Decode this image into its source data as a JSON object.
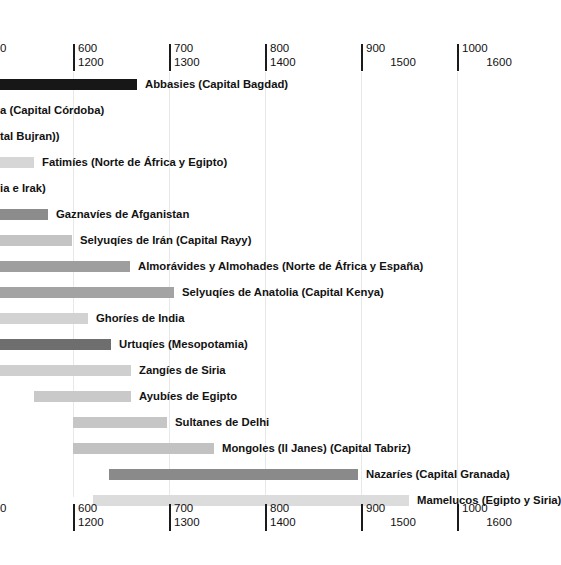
{
  "chart_data": {
    "type": "bar",
    "chart_subtype": "timeline-gantt",
    "title": "",
    "xlabel": "",
    "ylabel": "",
    "grid": true,
    "legend_position": "none",
    "orientation": "horizontal",
    "note": "Horizontal timeline (Gantt) of Islamic dynasties. View is panned/cropped: the left portion of the chart and several bars extend off-screen to the left. Axis has two label rows: upper row = Hijri (AH) years, lower row = Gregorian (CE) years.",
    "axis": {
      "primary_label_series": "hijri",
      "secondary_label_series": "gregorian",
      "px_per_100_years": 96,
      "ticks": [
        {
          "hijri": "",
          "gregorian": "",
          "partial_hijri": "0",
          "partial_gregorian": "",
          "x": -5,
          "clipped": true
        },
        {
          "hijri": "600",
          "gregorian": "1200",
          "x": 73,
          "clipped": false
        },
        {
          "hijri": "700",
          "gregorian": "1300",
          "x": 169,
          "clipped": false
        },
        {
          "hijri": "800",
          "gregorian": "1400",
          "x": 265,
          "clipped": false
        },
        {
          "hijri": "900",
          "gregorian": "1500",
          "x": 361,
          "clipped": false,
          "gregorian_centered": true
        },
        {
          "hijri": "1000",
          "gregorian": "1600",
          "x": 457,
          "clipped": false,
          "gregorian_centered": true
        }
      ]
    },
    "bars": [
      {
        "label": "Abbasies (Capital Bagdad)",
        "x": 0,
        "width": 137,
        "color": "#171717",
        "label_x": 145,
        "clipped_left": true,
        "clipped_label": false
      },
      {
        "label": "a (Capital Córdoba)",
        "x": 0,
        "width": 0,
        "color": "#8f8f8f",
        "label_x": 0,
        "clipped_left": true,
        "clipped_label": true
      },
      {
        "label": "tal Bujran))",
        "x": 0,
        "width": 0,
        "color": "#a8a8a8",
        "label_x": 0,
        "clipped_left": true,
        "clipped_label": true
      },
      {
        "label": "Fatimíes (Norte de África y Egipto)",
        "x": 0,
        "width": 34,
        "color": "#d6d6d6",
        "label_x": 42,
        "clipped_left": true,
        "clipped_label": false
      },
      {
        "label": "ia e Irak)",
        "x": 0,
        "width": 0,
        "color": "#bdbdbd",
        "label_x": 0,
        "clipped_left": true,
        "clipped_label": true
      },
      {
        "label": "Gaznavíes de Afganistan",
        "x": 0,
        "width": 48,
        "color": "#8c8c8c",
        "label_x": 56,
        "clipped_left": true,
        "clipped_label": false
      },
      {
        "label": "Selyuqíes de Irán (Capital Rayy)",
        "x": 0,
        "width": 72,
        "color": "#c4c4c4",
        "label_x": 80,
        "clipped_left": true,
        "clipped_label": false
      },
      {
        "label": "Almorávides y Almohades (Norte de África y España)",
        "x": 0,
        "width": 130,
        "color": "#9e9e9e",
        "label_x": 138,
        "clipped_left": true,
        "clipped_label": false
      },
      {
        "label": "Selyuqíes de Anatolia (Capital Kenya)",
        "x": 0,
        "width": 174,
        "color": "#a3a3a3",
        "label_x": 182,
        "clipped_left": true,
        "clipped_label": false
      },
      {
        "label": "Ghoríes de India",
        "x": 0,
        "width": 88,
        "color": "#d2d2d2",
        "label_x": 96,
        "clipped_left": true,
        "clipped_label": false
      },
      {
        "label": "Urtuqíes (Mesopotamia)",
        "x": 0,
        "width": 111,
        "color": "#6e6e6e",
        "label_x": 119,
        "clipped_left": true,
        "clipped_label": false
      },
      {
        "label": "Zangíes de Siria",
        "x": 0,
        "width": 131,
        "color": "#cfcfcf",
        "label_x": 139,
        "clipped_left": true,
        "clipped_label": false
      },
      {
        "label": "Ayubíes de Egipto",
        "x": 34,
        "width": 97,
        "color": "#c9c9c9",
        "label_x": 139,
        "clipped_left": false,
        "clipped_label": false
      },
      {
        "label": "Sultanes de Delhi",
        "x": 73,
        "width": 94,
        "color": "#c6c6c6",
        "label_x": 175,
        "clipped_left": false,
        "clipped_label": false
      },
      {
        "label": "Mongoles (Il Janes) (Capital Tabriz)",
        "x": 73,
        "width": 141,
        "color": "#c2c2c2",
        "label_x": 222,
        "clipped_left": false,
        "clipped_label": false
      },
      {
        "label": "Nazaríes (Capital Granada)",
        "x": 109,
        "width": 249,
        "color": "#8a8a8a",
        "label_x": 366,
        "clipped_left": false,
        "clipped_label": false
      },
      {
        "label": "Mamelucos (Egipto y Siria)",
        "x": 93,
        "width": 316,
        "color": "#dcdcdc",
        "label_x": 417,
        "clipped_left": false,
        "clipped_label": false
      }
    ]
  },
  "colors": {
    "background": "#ffffff",
    "gridline": "#e8e8e8",
    "axis_tick": "#1b1b1b",
    "text": "#111111"
  }
}
